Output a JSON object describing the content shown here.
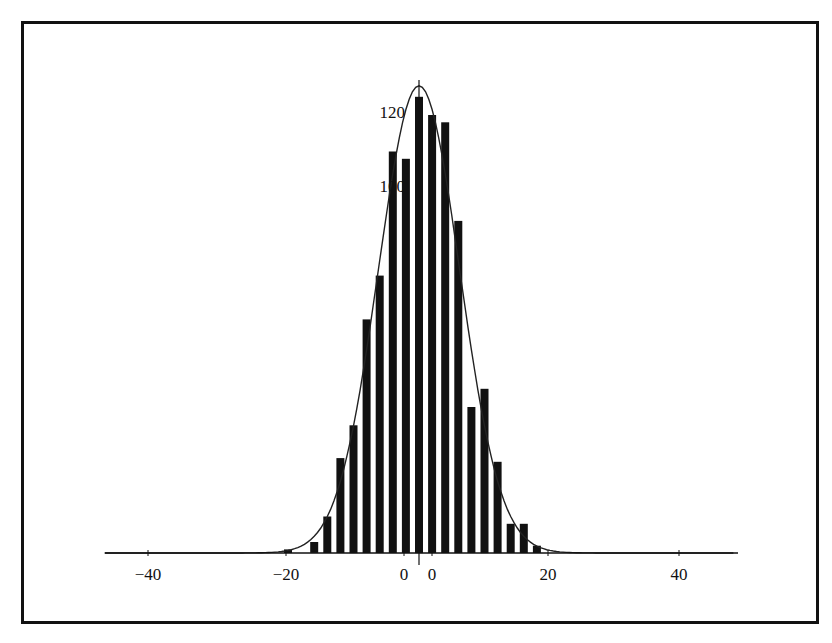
{
  "chart_data": {
    "type": "bar",
    "title": "",
    "xlabel": "",
    "ylabel": "",
    "x": [
      -20,
      -16,
      -14,
      -12,
      -10,
      -8,
      -6,
      -4,
      -2,
      0,
      2,
      4,
      6,
      8,
      10,
      12,
      14,
      16,
      18
    ],
    "values": [
      1,
      3,
      10,
      26,
      35,
      64,
      76,
      110,
      108,
      125,
      120,
      118,
      91,
      40,
      45,
      25,
      8,
      8,
      2
    ],
    "overlay": {
      "type": "line",
      "name": "normal fit curve",
      "peak": 128,
      "center": 0
    },
    "xlim": [
      -48,
      48
    ],
    "ylim": [
      0,
      130
    ],
    "x_ticks": [
      "-40",
      "-20",
      "0",
      "0",
      "20",
      "40"
    ],
    "y_ticks": [
      "20",
      "40",
      "60",
      "80",
      "100",
      "120"
    ],
    "grid": false,
    "legend": "none"
  },
  "axis": {
    "x_labels": [
      {
        "text": "−40",
        "x": 148
      },
      {
        "text": "−20",
        "x": 286
      },
      {
        "text": "0",
        "x": 404
      },
      {
        "text": "0",
        "x": 432
      },
      {
        "text": "20",
        "x": 548
      },
      {
        "text": "40",
        "x": 679
      }
    ],
    "y_labels": [
      {
        "text": "120",
        "y": 118
      },
      {
        "text": "100",
        "y": 192
      }
    ]
  },
  "colors": {
    "bar": "#111111",
    "curve": "#222222",
    "frame": "#111111",
    "background": "#ffffff"
  }
}
